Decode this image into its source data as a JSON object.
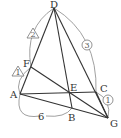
{
  "diagram": {
    "points": {
      "D": {
        "label": "D",
        "x": 54,
        "y": 8
      },
      "F": {
        "label": "F",
        "x": 31,
        "y": 67
      },
      "A": {
        "label": "A",
        "x": 20,
        "y": 94
      },
      "E": {
        "label": "E",
        "x": 70,
        "y": 93
      },
      "C": {
        "label": "C",
        "x": 96,
        "y": 92
      },
      "B": {
        "label": "B",
        "x": 72,
        "y": 108
      },
      "G": {
        "label": "G",
        "x": 108,
        "y": 118
      }
    },
    "segments": [
      "D-A",
      "D-B",
      "D-G",
      "A-C",
      "A-G",
      "F-G",
      "C-G"
    ],
    "annotations": {
      "DF_ratio": "2",
      "FA_ratio": "1",
      "DC_ratio": "3",
      "CG_ratio": "1",
      "AB_length": "6"
    },
    "colors": {
      "line": "#333333",
      "arc": "#777777"
    }
  }
}
